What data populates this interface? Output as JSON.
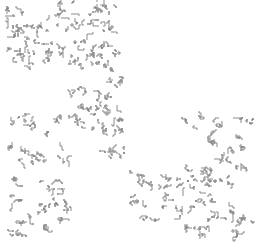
{
  "image": {
    "description": "Grayscale fractal curve pattern composed of clustered squiggle motifs on white background",
    "stroke_color": "#8a8a8a",
    "background": "#ffffff",
    "clusters": [
      [
        6,
        4,
        22
      ],
      [
        50,
        2,
        24
      ],
      [
        78,
        2,
        22
      ],
      [
        100,
        4,
        14
      ],
      [
        6,
        22,
        22
      ],
      [
        30,
        18,
        22
      ],
      [
        58,
        14,
        22
      ],
      [
        84,
        16,
        18
      ],
      [
        100,
        24,
        14
      ],
      [
        22,
        38,
        22
      ],
      [
        48,
        40,
        22
      ],
      [
        72,
        40,
        20
      ],
      [
        94,
        42,
        20
      ],
      [
        108,
        46,
        14
      ],
      [
        6,
        48,
        18
      ],
      [
        10,
        26,
        14
      ],
      [
        20,
        56,
        18
      ],
      [
        42,
        52,
        18
      ],
      [
        68,
        54,
        18
      ],
      [
        88,
        56,
        14
      ],
      [
        96,
        60,
        18
      ],
      [
        104,
        76,
        18
      ],
      [
        96,
        92,
        18
      ],
      [
        68,
        88,
        16
      ],
      [
        72,
        100,
        22
      ],
      [
        94,
        104,
        20
      ],
      [
        108,
        112,
        14
      ],
      [
        10,
        116,
        18
      ],
      [
        30,
        120,
        20
      ],
      [
        54,
        116,
        16
      ],
      [
        70,
        118,
        18
      ],
      [
        90,
        122,
        18
      ],
      [
        110,
        124,
        16
      ],
      [
        10,
        142,
        16
      ],
      [
        20,
        150,
        18
      ],
      [
        36,
        156,
        16
      ],
      [
        52,
        150,
        16
      ],
      [
        100,
        148,
        16
      ],
      [
        114,
        150,
        14
      ],
      [
        10,
        178,
        16
      ],
      [
        40,
        178,
        20
      ],
      [
        52,
        192,
        20
      ],
      [
        60,
        210,
        16
      ],
      [
        10,
        194,
        16
      ],
      [
        20,
        212,
        16
      ],
      [
        32,
        204,
        18
      ],
      [
        44,
        222,
        14
      ],
      [
        10,
        228,
        14
      ],
      [
        184,
        116,
        18
      ],
      [
        206,
        120,
        18
      ],
      [
        236,
        118,
        18
      ],
      [
        202,
        134,
        16
      ],
      [
        230,
        138,
        16
      ],
      [
        214,
        148,
        18
      ],
      [
        228,
        160,
        16
      ],
      [
        204,
        166,
        16
      ],
      [
        188,
        170,
        14
      ],
      [
        130,
        174,
        18
      ],
      [
        150,
        180,
        18
      ],
      [
        166,
        176,
        18
      ],
      [
        182,
        178,
        18
      ],
      [
        196,
        180,
        18
      ],
      [
        214,
        176,
        16
      ],
      [
        130,
        194,
        16
      ],
      [
        142,
        210,
        16
      ],
      [
        162,
        198,
        16
      ],
      [
        176,
        206,
        18
      ],
      [
        196,
        196,
        18
      ],
      [
        206,
        210,
        16
      ],
      [
        226,
        206,
        18
      ],
      [
        238,
        216,
        14
      ],
      [
        180,
        224,
        16
      ],
      [
        200,
        228,
        14
      ],
      [
        230,
        228,
        14
      ]
    ]
  }
}
